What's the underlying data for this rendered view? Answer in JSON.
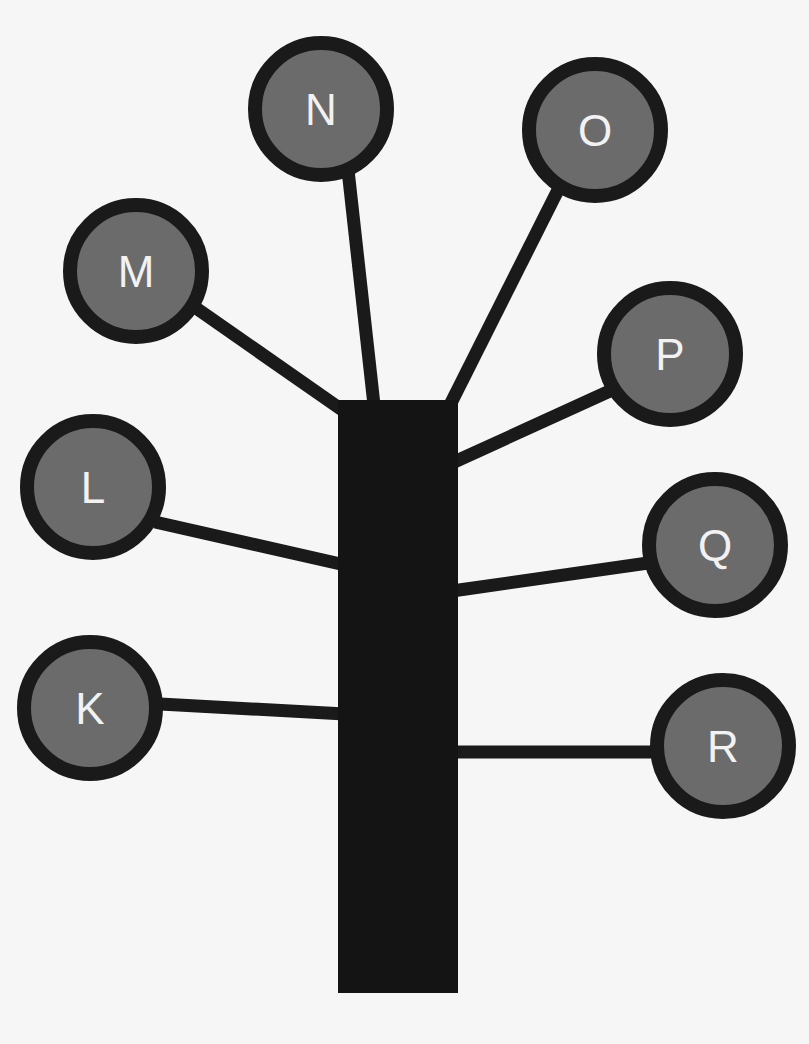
{
  "diagram": {
    "type": "tree",
    "colors": {
      "background": "#f6f6f6",
      "trunk": "#141414",
      "branch": "#1a1a1a",
      "node_fill": "#6b6b6b",
      "node_stroke": "#1a1a1a",
      "label": "#f2f2f2"
    },
    "trunk": {
      "x": 338,
      "y": 400,
      "width": 120,
      "height": 593
    },
    "nodes": [
      {
        "id": "K",
        "label": "K",
        "cx": 90,
        "cy": 708,
        "side": "left",
        "branch": {
          "x1": 160,
          "y1": 704,
          "x2": 345,
          "y2": 714
        }
      },
      {
        "id": "L",
        "label": "L",
        "cx": 93,
        "cy": 487,
        "side": "left",
        "branch": {
          "x1": 155,
          "y1": 522,
          "x2": 345,
          "y2": 565
        }
      },
      {
        "id": "M",
        "label": "M",
        "cx": 136,
        "cy": 271,
        "side": "left",
        "branch": {
          "x1": 196,
          "y1": 308,
          "x2": 345,
          "y2": 412
        }
      },
      {
        "id": "N",
        "label": "N",
        "cx": 321,
        "cy": 109,
        "side": "top",
        "branch": {
          "x1": 348,
          "y1": 170,
          "x2": 374,
          "y2": 405
        }
      },
      {
        "id": "O",
        "label": "O",
        "cx": 595,
        "cy": 130,
        "side": "top",
        "branch": {
          "x1": 558,
          "y1": 190,
          "x2": 450,
          "y2": 405
        }
      },
      {
        "id": "P",
        "label": "P",
        "cx": 670,
        "cy": 354,
        "side": "right",
        "branch": {
          "x1": 612,
          "y1": 390,
          "x2": 452,
          "y2": 463
        }
      },
      {
        "id": "Q",
        "label": "Q",
        "cx": 715,
        "cy": 545,
        "side": "right",
        "branch": {
          "x1": 648,
          "y1": 563,
          "x2": 452,
          "y2": 591
        }
      },
      {
        "id": "R",
        "label": "R",
        "cx": 723,
        "cy": 746,
        "side": "right",
        "branch": {
          "x1": 655,
          "y1": 752,
          "x2": 452,
          "y2": 752
        }
      }
    ],
    "node_radius": 66,
    "node_stroke_width": 14,
    "branch_width": 13
  }
}
